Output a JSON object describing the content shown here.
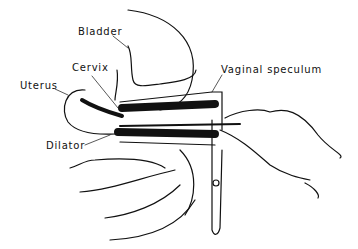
{
  "labels": {
    "bladder": "Bladder",
    "cervix": "Cervix",
    "uterus": "Uterus",
    "dilator": "Dilator",
    "speculum": "Vaginal speculum"
  }
}
